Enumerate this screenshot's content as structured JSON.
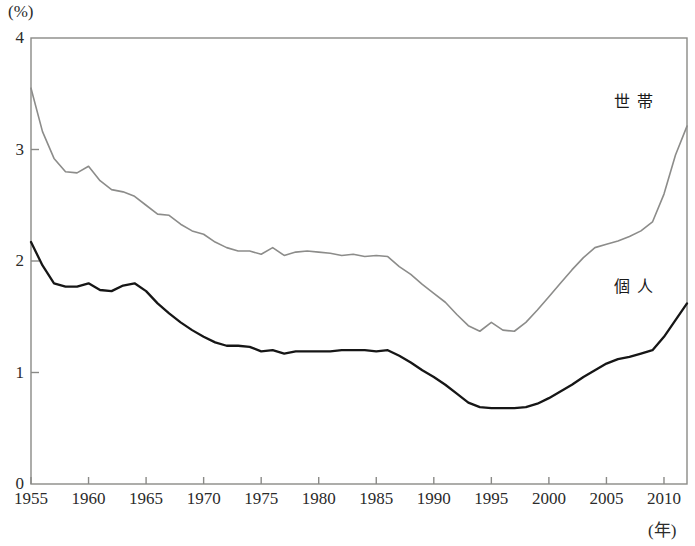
{
  "chart_data": {
    "type": "line",
    "title": "",
    "xlabel": "(年)",
    "ylabel": "(%)",
    "xlim": [
      1955,
      2012
    ],
    "ylim": [
      0,
      4
    ],
    "ytick_labels": [
      "0",
      "1",
      "2",
      "3",
      "4"
    ],
    "ytick_values": [
      0,
      1,
      2,
      3,
      4
    ],
    "xtick_labels": [
      "1955",
      "1960",
      "1965",
      "1970",
      "1975",
      "1980",
      "1985",
      "1990",
      "1995",
      "2000",
      "2005",
      "2010"
    ],
    "xtick_values": [
      1955,
      1960,
      1965,
      1970,
      1975,
      1980,
      1985,
      1990,
      1995,
      2000,
      2005,
      2010
    ],
    "grid": false,
    "legend_position": "inline-right",
    "x": [
      1955,
      1956,
      1957,
      1958,
      1959,
      1960,
      1961,
      1962,
      1963,
      1964,
      1965,
      1966,
      1967,
      1968,
      1969,
      1970,
      1971,
      1972,
      1973,
      1974,
      1975,
      1976,
      1977,
      1978,
      1979,
      1980,
      1981,
      1982,
      1983,
      1984,
      1985,
      1986,
      1987,
      1988,
      1989,
      1990,
      1991,
      1992,
      1993,
      1994,
      1995,
      1996,
      1997,
      1998,
      1999,
      2000,
      2001,
      2002,
      2003,
      2004,
      2005,
      2006,
      2007,
      2008,
      2009,
      2010,
      2011,
      2012
    ],
    "series": [
      {
        "name": "世帯",
        "color": "#8c8c8a",
        "values": [
          3.55,
          3.16,
          2.92,
          2.8,
          2.79,
          2.85,
          2.72,
          2.64,
          2.62,
          2.58,
          2.5,
          2.42,
          2.41,
          2.33,
          2.27,
          2.24,
          2.17,
          2.12,
          2.09,
          2.09,
          2.06,
          2.12,
          2.05,
          2.08,
          2.09,
          2.08,
          2.07,
          2.05,
          2.06,
          2.04,
          2.05,
          2.04,
          1.95,
          1.88,
          1.79,
          1.71,
          1.63,
          1.52,
          1.42,
          1.37,
          1.45,
          1.38,
          1.37,
          1.45,
          1.56,
          1.68,
          1.8,
          1.92,
          2.03,
          2.12,
          2.15,
          2.18,
          2.22,
          2.27,
          2.35,
          2.6,
          2.95,
          3.21
        ]
      },
      {
        "name": "個人",
        "color": "#161616",
        "values": [
          2.17,
          1.96,
          1.8,
          1.77,
          1.77,
          1.8,
          1.74,
          1.73,
          1.78,
          1.8,
          1.73,
          1.62,
          1.53,
          1.45,
          1.38,
          1.32,
          1.27,
          1.24,
          1.24,
          1.23,
          1.19,
          1.2,
          1.17,
          1.19,
          1.19,
          1.19,
          1.19,
          1.2,
          1.2,
          1.2,
          1.19,
          1.2,
          1.15,
          1.09,
          1.02,
          0.96,
          0.89,
          0.81,
          0.73,
          0.69,
          0.68,
          0.68,
          0.68,
          0.69,
          0.72,
          0.77,
          0.83,
          0.89,
          0.96,
          1.02,
          1.08,
          1.12,
          1.14,
          1.17,
          1.2,
          1.32,
          1.47,
          1.62
        ]
      }
    ]
  },
  "axes": {
    "y_unit": "(%)",
    "x_unit": "(年)"
  },
  "labels": {
    "household": "世帯",
    "individual": "個人"
  }
}
